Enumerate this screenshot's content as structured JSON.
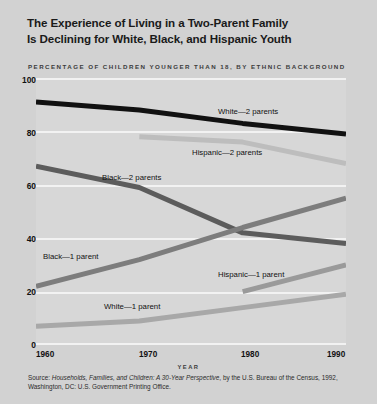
{
  "title": {
    "line1": "The Experience of Living in a Two-Parent Family",
    "line2": "Is Declining for White, Black, and Hispanic Youth"
  },
  "subtitle": "PERCENTAGE OF CHILDREN YOUNGER THAN 18, BY ETHNIC BACKGROUND",
  "source": {
    "prefix": "Source: ",
    "italic": "Households, Families, and Children: A 30-Year Perspective",
    "suffix": ", by the U.S. Bureau of the Census, 1992, Washington, DC: U.S. Government Printing Office."
  },
  "colors": {
    "background": "#d2d2d2",
    "plot_background": "#d7d7d7",
    "gridline": "#f2f2f2",
    "white_2_parents": "#111111",
    "hispanic_2_parents": "#bdbdbd",
    "black_2_parents": "#5c5c5c",
    "black_1_parent": "#7d7d7d",
    "hispanic_1_parent": "#9a9a9a",
    "white_1_parent": "#a8a8a8"
  },
  "labels": {
    "white_2_parents": "White—2 parents",
    "hispanic_2_parents": "Hispanic—2 parents",
    "black_2_parents": "Black—2 parents",
    "black_1_parent": "Black—1 parent",
    "hispanic_1_parent": "Hispanic—1 parent",
    "white_1_parent": "White—1 parent"
  },
  "yticks": [
    "100",
    "80",
    "60",
    "40",
    "20",
    "0"
  ],
  "xticks": [
    "1960",
    "1970",
    "1980",
    "1990"
  ],
  "chart_data": {
    "type": "line",
    "title": "The Experience of Living in a Two-Parent Family Is Declining for White, Black, and Hispanic Youth",
    "subtitle": "PERCENTAGE OF CHILDREN YOUNGER THAN 18, BY ETHNIC BACKGROUND",
    "xlabel": "YEAR",
    "ylabel": "",
    "x": [
      1960,
      1970,
      1980,
      1990
    ],
    "xlim": [
      1960,
      1990
    ],
    "ylim": [
      0,
      100
    ],
    "yticks": [
      0,
      20,
      40,
      60,
      80,
      100
    ],
    "xticks": [
      1960,
      1970,
      1980,
      1990
    ],
    "grid": "horizontal",
    "legend": "inline-annotations",
    "series": [
      {
        "name": "White—2 parents",
        "color": "#111111",
        "x": [
          1960,
          1970,
          1980,
          1990
        ],
        "values": [
          91,
          88,
          83,
          79
        ]
      },
      {
        "name": "Hispanic—2 parents",
        "color": "#bdbdbd",
        "x": [
          1970,
          1980,
          1990
        ],
        "values": [
          78,
          76,
          68
        ]
      },
      {
        "name": "Black—2 parents",
        "color": "#5c5c5c",
        "x": [
          1960,
          1970,
          1980,
          1990
        ],
        "values": [
          67,
          59,
          42,
          38
        ]
      },
      {
        "name": "Black—1 parent",
        "color": "#7d7d7d",
        "x": [
          1960,
          1970,
          1980,
          1990
        ],
        "values": [
          22,
          32,
          44,
          55
        ]
      },
      {
        "name": "Hispanic—1 parent",
        "color": "#9a9a9a",
        "x": [
          1980,
          1990
        ],
        "values": [
          20,
          30
        ]
      },
      {
        "name": "White—1 parent",
        "color": "#a8a8a8",
        "x": [
          1960,
          1970,
          1980,
          1990
        ],
        "values": [
          7,
          9,
          14,
          19
        ]
      }
    ]
  }
}
